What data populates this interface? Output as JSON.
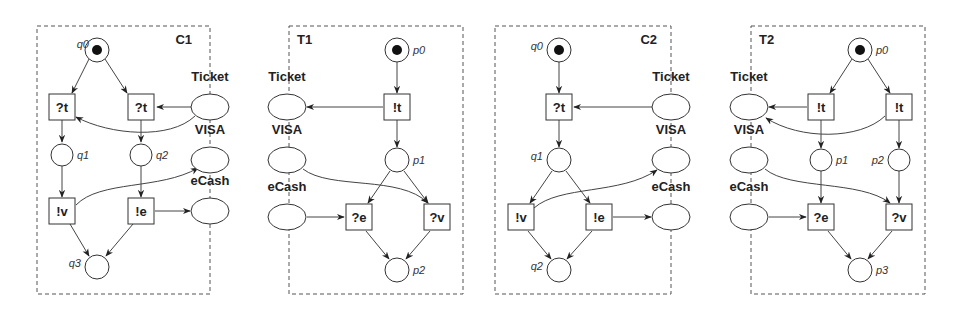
{
  "panels": [
    {
      "id": "C1",
      "title": "C1",
      "frame": {
        "x": 37,
        "y": 26,
        "w": 173,
        "h": 268
      },
      "title_pos": {
        "x": 192,
        "y": 44,
        "anchor": "end"
      },
      "places": [
        {
          "id": "q0",
          "label": "q0",
          "x": 97,
          "y": 50,
          "r": 12,
          "token": true,
          "lx": -8,
          "ly": -2,
          "anchor": "end"
        },
        {
          "id": "q1",
          "label": "q1",
          "x": 62,
          "y": 155,
          "r": 11,
          "token": false,
          "lx": 15,
          "ly": 4,
          "anchor": "start"
        },
        {
          "id": "q2",
          "label": "q2",
          "x": 141,
          "y": 155,
          "r": 11,
          "token": false,
          "lx": 15,
          "ly": 4,
          "anchor": "start"
        },
        {
          "id": "q3",
          "label": "q3",
          "x": 97,
          "y": 267,
          "r": 12,
          "token": false,
          "lx": -16,
          "ly": 0,
          "anchor": "end"
        }
      ],
      "channels": [
        {
          "id": "Ticket",
          "label": "Ticket",
          "x": 210,
          "y": 107,
          "lx": 0,
          "ly": -26
        },
        {
          "id": "VISA",
          "label": "VISA",
          "x": 210,
          "y": 160,
          "lx": 0,
          "ly": -26
        },
        {
          "id": "eCash",
          "label": "eCash",
          "x": 210,
          "y": 211,
          "lx": 0,
          "ly": -26
        }
      ],
      "transitions": [
        {
          "id": "t1",
          "label": "?t",
          "x": 62,
          "y": 107
        },
        {
          "id": "t2",
          "label": "?t",
          "x": 141,
          "y": 107
        },
        {
          "id": "t3",
          "label": "!v",
          "x": 62,
          "y": 211
        },
        {
          "id": "t4",
          "label": "!e",
          "x": 141,
          "y": 211
        }
      ],
      "arcs": [
        "M89,59 L72,93",
        "M105,59 L127,93",
        "M191,107 L157,107",
        "M195,116 C170,140 110,135 76,117",
        "M62,120 L62,142",
        "M141,120 L141,142",
        "M62,166 L62,197",
        "M141,166 L141,197",
        "M76,205 C100,180 160,190 198,168",
        "M155,211 L190,211",
        "M70,224 L89,256",
        "M133,224 L106,256"
      ]
    },
    {
      "id": "T1",
      "title": "T1",
      "frame": {
        "x": 289,
        "y": 26,
        "w": 174,
        "h": 268
      },
      "title_pos": {
        "x": 297,
        "y": 44,
        "anchor": "start"
      },
      "places": [
        {
          "id": "p0",
          "label": "p0",
          "x": 397,
          "y": 50,
          "r": 12,
          "token": true,
          "lx": 16,
          "ly": 4,
          "anchor": "start"
        },
        {
          "id": "p1",
          "label": "p1",
          "x": 397,
          "y": 160,
          "r": 12,
          "token": false,
          "lx": 16,
          "ly": 4,
          "anchor": "start"
        },
        {
          "id": "p2",
          "label": "p2",
          "x": 397,
          "y": 270,
          "r": 12,
          "token": false,
          "lx": 16,
          "ly": 4,
          "anchor": "start"
        }
      ],
      "channels": [
        {
          "id": "Ticket",
          "label": "Ticket",
          "x": 287,
          "y": 107,
          "lx": 0,
          "ly": -26
        },
        {
          "id": "VISA",
          "label": "VISA",
          "x": 287,
          "y": 160,
          "lx": 0,
          "ly": -26
        },
        {
          "id": "eCash",
          "label": "eCash",
          "x": 287,
          "y": 217,
          "lx": 0,
          "ly": -26
        }
      ],
      "transitions": [
        {
          "id": "t1",
          "label": "!t",
          "x": 397,
          "y": 107
        },
        {
          "id": "t2",
          "label": "?e",
          "x": 359,
          "y": 217
        },
        {
          "id": "t3",
          "label": "?v",
          "x": 437,
          "y": 217
        }
      ],
      "arcs": [
        "M397,62 L397,93",
        "M383,107 L307,107",
        "M397,120 L397,147",
        "M303,169 C330,190 400,175 428,203",
        "M390,171 L368,203",
        "M404,171 L428,203",
        "M307,217 L344,217",
        "M366,231 L389,259",
        "M430,231 L406,259"
      ]
    },
    {
      "id": "C2",
      "title": "C2",
      "frame": {
        "x": 495,
        "y": 26,
        "w": 176,
        "h": 268
      },
      "title_pos": {
        "x": 657,
        "y": 44,
        "anchor": "end"
      },
      "places": [
        {
          "id": "q0",
          "label": "q0",
          "x": 559,
          "y": 50,
          "r": 12,
          "token": true,
          "lx": -16,
          "ly": 0,
          "anchor": "end"
        },
        {
          "id": "q1",
          "label": "q1",
          "x": 559,
          "y": 160,
          "r": 12,
          "token": false,
          "lx": -16,
          "ly": 0,
          "anchor": "end"
        },
        {
          "id": "q2",
          "label": "q2",
          "x": 559,
          "y": 270,
          "r": 12,
          "token": false,
          "lx": -16,
          "ly": 0,
          "anchor": "end"
        }
      ],
      "channels": [
        {
          "id": "Ticket",
          "label": "Ticket",
          "x": 671,
          "y": 107,
          "lx": 0,
          "ly": -26
        },
        {
          "id": "VISA",
          "label": "VISA",
          "x": 671,
          "y": 160,
          "lx": 0,
          "ly": -26
        },
        {
          "id": "eCash",
          "label": "eCash",
          "x": 671,
          "y": 217,
          "lx": 0,
          "ly": -26
        }
      ],
      "transitions": [
        {
          "id": "t1",
          "label": "?t",
          "x": 559,
          "y": 107
        },
        {
          "id": "t2",
          "label": "!v",
          "x": 521,
          "y": 217
        },
        {
          "id": "t3",
          "label": "!e",
          "x": 599,
          "y": 217
        }
      ],
      "arcs": [
        "M559,62 L559,93",
        "M652,107 L574,107",
        "M559,120 L559,147",
        "M552,171 L530,203",
        "M566,171 L590,203",
        "M534,208 C560,185 620,195 657,170",
        "M613,217 L651,217",
        "M528,231 L551,259",
        "M592,231 L567,259"
      ]
    },
    {
      "id": "T2",
      "title": "T2",
      "frame": {
        "x": 751,
        "y": 26,
        "w": 174,
        "h": 268
      },
      "title_pos": {
        "x": 759,
        "y": 44,
        "anchor": "start"
      },
      "places": [
        {
          "id": "p0",
          "label": "p0",
          "x": 860,
          "y": 50,
          "r": 12,
          "token": true,
          "lx": 16,
          "ly": 4,
          "anchor": "start"
        },
        {
          "id": "p1",
          "label": "p1",
          "x": 821,
          "y": 160,
          "r": 11,
          "token": false,
          "lx": 15,
          "ly": 4,
          "anchor": "start"
        },
        {
          "id": "p2",
          "label": "p2",
          "x": 899,
          "y": 160,
          "r": 11,
          "token": false,
          "lx": -15,
          "ly": 4,
          "anchor": "end"
        },
        {
          "id": "p3",
          "label": "p3",
          "x": 860,
          "y": 270,
          "r": 12,
          "token": false,
          "lx": 16,
          "ly": 4,
          "anchor": "start"
        }
      ],
      "channels": [
        {
          "id": "Ticket",
          "label": "Ticket",
          "x": 749,
          "y": 107,
          "lx": 0,
          "ly": -26
        },
        {
          "id": "VISA",
          "label": "VISA",
          "x": 749,
          "y": 160,
          "lx": 0,
          "ly": -26
        },
        {
          "id": "eCash",
          "label": "eCash",
          "x": 749,
          "y": 217,
          "lx": 0,
          "ly": -26
        }
      ],
      "transitions": [
        {
          "id": "t1",
          "label": "!t",
          "x": 821,
          "y": 107
        },
        {
          "id": "t2",
          "label": "!t",
          "x": 899,
          "y": 107
        },
        {
          "id": "t3",
          "label": "?e",
          "x": 821,
          "y": 217
        },
        {
          "id": "t4",
          "label": "?v",
          "x": 899,
          "y": 217
        }
      ],
      "arcs": [
        "M852,59 L830,93",
        "M868,59 L890,93",
        "M807,107 L769,107",
        "M885,116 C860,140 800,140 766,118",
        "M821,120 L821,148",
        "M899,120 L899,148",
        "M821,171 L821,203",
        "M899,171 L899,203",
        "M765,169 C790,190 860,180 890,203",
        "M769,217 L806,217",
        "M828,231 L851,259",
        "M892,231 L868,259"
      ]
    }
  ]
}
